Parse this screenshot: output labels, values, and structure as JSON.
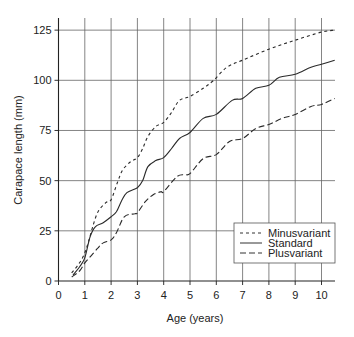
{
  "chart_data": {
    "type": "line",
    "title": "",
    "xlabel": "Age (years)",
    "ylabel": "Carapace length (mm)",
    "xlim": [
      0,
      10.5
    ],
    "ylim": [
      0,
      130
    ],
    "xticks": [
      "0",
      "1",
      "2",
      "3",
      "4",
      "5",
      "6",
      "7",
      "8",
      "9",
      "10"
    ],
    "yticks": [
      "0",
      "25",
      "50",
      "75",
      "100",
      "125"
    ],
    "grid": true,
    "legend_position": "bottom-right",
    "series": [
      {
        "name": "Minusvariant",
        "style": "short-dash",
        "x": [
          0.5,
          0.8,
          1.0,
          1.15,
          1.3,
          1.5,
          1.8,
          2.0,
          2.25,
          2.45,
          2.75,
          3.0,
          3.2,
          3.4,
          3.7,
          4.0,
          4.3,
          4.6,
          5.0,
          5.5,
          5.9,
          6.4,
          7.0,
          8.0,
          9.0,
          10.0,
          10.5
        ],
        "y": [
          4,
          9,
          14,
          20,
          27,
          34.5,
          39,
          40.5,
          49.5,
          55.5,
          59.5,
          61.5,
          66,
          72,
          77,
          79,
          84,
          90,
          92,
          96,
          100,
          106.5,
          110,
          115.5,
          120,
          124,
          125
        ]
      },
      {
        "name": "Standard",
        "style": "solid",
        "x": [
          0.55,
          0.8,
          1.0,
          1.2,
          1.4,
          1.7,
          2.0,
          2.2,
          2.4,
          2.6,
          3.0,
          3.2,
          3.4,
          3.7,
          4.0,
          4.3,
          4.6,
          5.0,
          5.5,
          6.0,
          6.6,
          7.0,
          7.5,
          8.0,
          8.4,
          9.0,
          9.6,
          10.0,
          10.5
        ],
        "y": [
          3,
          7,
          11.5,
          22,
          27,
          29,
          32,
          34.5,
          40,
          44,
          46.5,
          50,
          57,
          60,
          61.5,
          66,
          71,
          74,
          81,
          83,
          90,
          91,
          96,
          97.5,
          101.5,
          103,
          106.5,
          108,
          110
        ]
      },
      {
        "name": "Plusvariant",
        "style": "long-dash",
        "x": [
          0.5,
          0.8,
          1.0,
          1.2,
          1.5,
          1.7,
          2.0,
          2.2,
          2.5,
          2.9,
          3.0,
          3.3,
          3.6,
          3.9,
          4.0,
          4.5,
          4.8,
          5.0,
          5.5,
          6.0,
          6.5,
          7.0,
          7.5,
          8.0,
          8.5,
          9.0,
          9.6,
          10.0,
          10.5
        ],
        "y": [
          2,
          5,
          9,
          12,
          16.5,
          19,
          20.5,
          24,
          32,
          33.5,
          34,
          39.5,
          43,
          44.5,
          44.5,
          52,
          53,
          53.5,
          61,
          63,
          69.5,
          71,
          76,
          78,
          81,
          83,
          87,
          88,
          91
        ]
      }
    ]
  }
}
